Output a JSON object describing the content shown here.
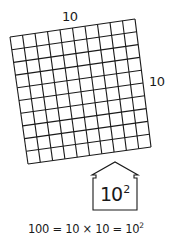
{
  "diagram": {
    "type": "area-grid-square-illustration",
    "grid": {
      "rows": 10,
      "columns": 10,
      "top_label": "10",
      "side_label": "10",
      "line_color": "#1a1a1a",
      "corners": {
        "top_left": [
          10,
          37
        ],
        "top_right": [
          135,
          19
        ],
        "bottom_right": [
          151,
          147
        ],
        "bottom_left": [
          28,
          164
        ]
      }
    },
    "arrow_box": {
      "base": "10",
      "exponent": "2"
    },
    "equation": {
      "left": "100",
      "equals1": "=",
      "product": "10 × 10",
      "equals2": "=",
      "power_base": "10",
      "power_exponent": "2"
    }
  }
}
